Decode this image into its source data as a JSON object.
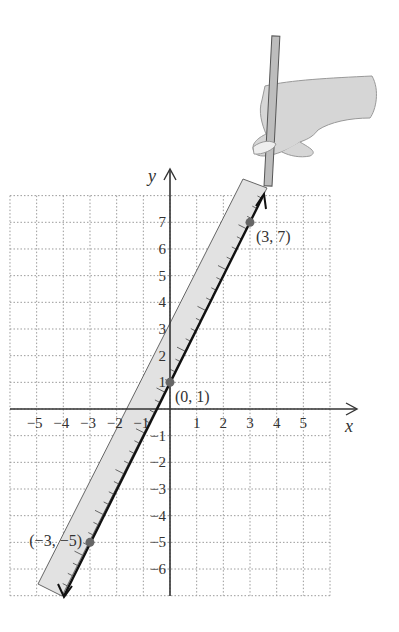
{
  "chart_data": {
    "type": "line",
    "title": "",
    "xlabel": "x",
    "ylabel": "y",
    "xlim": [
      -6,
      6
    ],
    "ylim": [
      -7,
      8
    ],
    "grid": true,
    "x_ticks": [
      "-5",
      "-4",
      "-3",
      "-2",
      "-1",
      "1",
      "2",
      "3",
      "4",
      "5"
    ],
    "y_ticks": [
      "7",
      "6",
      "5",
      "4",
      "3",
      "2",
      "1",
      "-1",
      "-2",
      "-3",
      "-4",
      "-5",
      "-6"
    ],
    "series": [
      {
        "name": "y = 2x + 1",
        "x": [
          -3,
          0,
          3
        ],
        "y": [
          -5,
          1,
          7
        ]
      }
    ],
    "points": [
      {
        "label": "(3, 7)",
        "x": 3,
        "y": 7
      },
      {
        "label": "(0, 1)",
        "x": 0,
        "y": 1
      },
      {
        "label": "(−3, −5)",
        "x": -3,
        "y": -5
      }
    ],
    "annotations": [
      "hand holding pencil drawing line along ruler"
    ]
  },
  "axes": {
    "x_name": "x",
    "y_name": "y"
  },
  "colors": {
    "grid": "#9a9a9a",
    "axis": "#333333",
    "line": "#111111",
    "ruler": "#e2e2e2",
    "point": "#666666",
    "hand": "#d6d6d6"
  }
}
